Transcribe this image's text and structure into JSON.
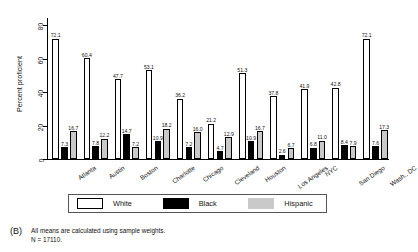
{
  "chart_data": {
    "type": "bar",
    "title": "",
    "xlabel": "",
    "ylabel": "Percent proficient",
    "ylim": [
      0,
      85
    ],
    "yticks": [
      0,
      20,
      40,
      60,
      80
    ],
    "ytick_labels": [
      "0",
      "20",
      "40",
      "60",
      "80"
    ],
    "grid": false,
    "legend_position": "bottom",
    "categories": [
      "Atlanta",
      "Austin",
      "Boston",
      "Charlotte",
      "Chicago",
      "Cleveland",
      "Houston",
      "Los Angeles",
      "NYC",
      "San Diego",
      "Wash., DC"
    ],
    "series": [
      {
        "name": "White",
        "color": "#ffffff",
        "values": [
          72.1,
          60.4,
          47.7,
          53.1,
          36.2,
          21.2,
          51.3,
          37.8,
          41.9,
          42.8,
          72.1
        ]
      },
      {
        "name": "Black",
        "color": "#000000",
        "values": [
          7.3,
          7.8,
          14.7,
          10.9,
          7.2,
          4.7,
          10.9,
          2.6,
          6.8,
          8.4,
          7.6
        ]
      },
      {
        "name": "Hispanic",
        "color": "#c9c9c9",
        "values": [
          16.7,
          12.2,
          7.2,
          18.2,
          16.0,
          12.9,
          16.7,
          6.7,
          11.0,
          7.9,
          17.3
        ]
      }
    ]
  },
  "legend": {
    "items": [
      {
        "label": "White",
        "swatch": "white"
      },
      {
        "label": "Black",
        "swatch": "black"
      },
      {
        "label": "Hispanic",
        "swatch": "hisp"
      }
    ]
  },
  "caption": {
    "tag": "(B)",
    "line1": "All means are calculated using sample weights.",
    "line2": "N = 17110."
  }
}
